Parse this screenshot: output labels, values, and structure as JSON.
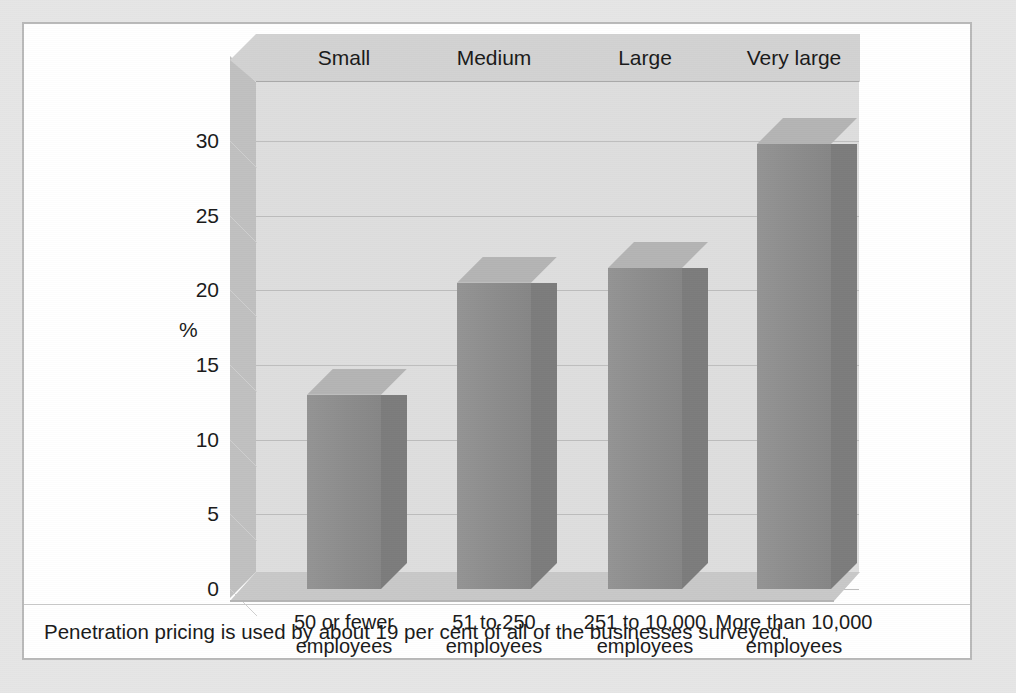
{
  "figure": {
    "caption": "Penetration pricing is used by about 19 per cent of all of the businesses surveyed.",
    "y_axis_caption": "%"
  },
  "colors": {
    "page_margin": "#e6e6e6",
    "panel_background": "#ffffff",
    "panel_border": "#b9b9b9",
    "back_wall": "#dedede",
    "side_wall": "#c0c0c0",
    "ceiling_band": "#d2d2d2",
    "floor": "#c8c8c8",
    "gridline": "#bdbdbd",
    "bar_front": "#8f8f8f",
    "bar_side": "#7c7c7c",
    "bar_top": "#b4b4b4",
    "text": "#1a1a1a"
  },
  "chart_data": {
    "type": "bar",
    "title": "",
    "subtitle": "",
    "xlabel": "",
    "ylabel": "%",
    "ylim": [
      0,
      30
    ],
    "yticks": [
      0,
      5,
      10,
      15,
      20,
      25,
      30
    ],
    "ytick_labels": [
      "0",
      "5",
      "10",
      "15",
      "20",
      "25",
      "30"
    ],
    "grid": true,
    "legend": "none",
    "three_d": true,
    "categories": [
      "50 or fewer employees",
      "51 to 250 employees",
      "251 to 10,000 employees",
      "More than 10,000 employees"
    ],
    "category_group_labels": [
      "Small",
      "Medium",
      "Large",
      "Very large"
    ],
    "values": [
      13,
      20.5,
      21.5,
      29.8
    ],
    "annotations": [
      "Penetration pricing is used by about 19 per cent of all of the businesses surveyed."
    ]
  },
  "category_headers": [
    {
      "label": "Small"
    },
    {
      "label": "Medium"
    },
    {
      "label": "Large"
    },
    {
      "label": "Very large"
    }
  ],
  "x_labels": [
    {
      "line1": "50 or fewer",
      "line2": "employees"
    },
    {
      "line1": "51 to 250",
      "line2": "employees"
    },
    {
      "line1": "251 to 10,000",
      "line2": "employees"
    },
    {
      "line1": "More than 10,000",
      "line2": "employees"
    }
  ],
  "y_ticks": [
    {
      "label": "30"
    },
    {
      "label": "25"
    },
    {
      "label": "20"
    },
    {
      "label": "15"
    },
    {
      "label": "10"
    },
    {
      "label": "5"
    },
    {
      "label": "0"
    }
  ]
}
